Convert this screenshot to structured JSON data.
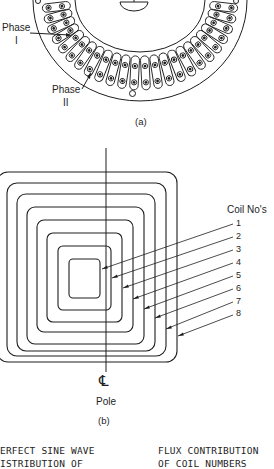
{
  "figure_a": {
    "caption": "(a)",
    "labels": {
      "phase1_line1": "Phase",
      "phase1_line2": "I",
      "phase2_line1": "Phase",
      "phase2_line2": "II"
    }
  },
  "figure_b": {
    "caption": "(b)",
    "coil_heading": "Coil No's",
    "coil_numbers": [
      "1",
      "2",
      "3",
      "4",
      "5",
      "6",
      "7",
      "8"
    ],
    "centerline_symbol": "℄",
    "pole_label": "Pole"
  },
  "figure_c": {
    "left_text_line1": "ERFECT SINE WAVE",
    "left_text_line2": "ISTRIBUTION OF",
    "right_text_line1": "FLUX CONTRIBUTION",
    "right_text_line2": "OF COIL NUMBERS"
  },
  "colors": {
    "ink": "#1e1e1e",
    "paper": "#ffffff"
  }
}
